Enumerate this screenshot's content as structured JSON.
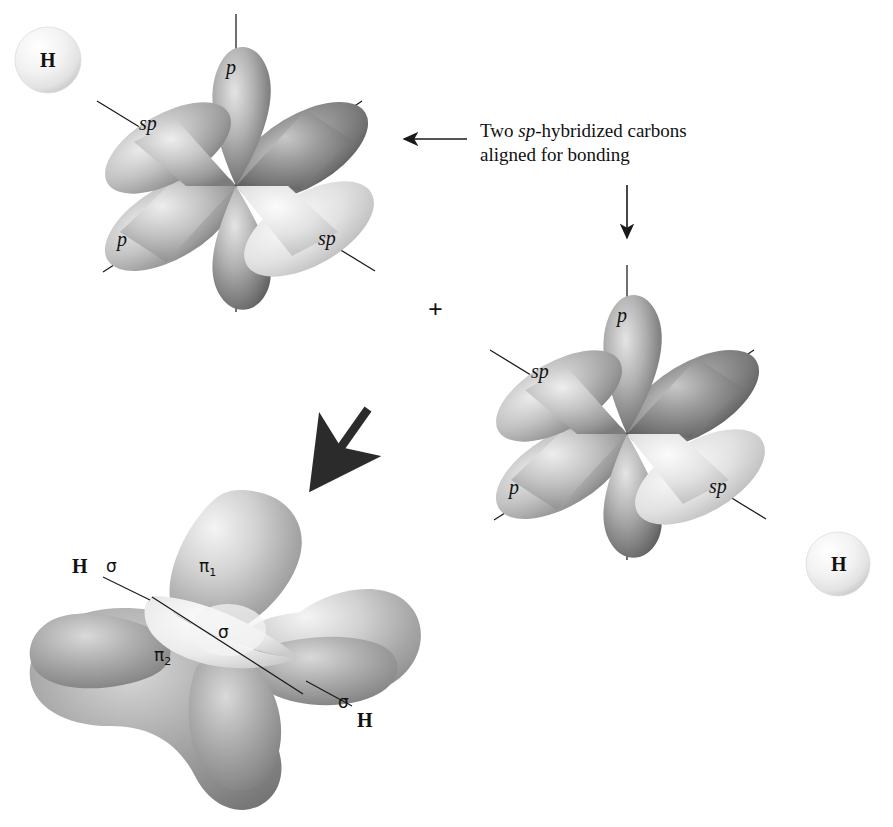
{
  "figure": {
    "plus_symbol": "+"
  },
  "annotation": {
    "line1_pre": "Two ",
    "line1_italic": "sp",
    "line1_post": "-hybridized carbons",
    "line2": "aligned for bonding"
  },
  "hydrogen_atoms": [
    {
      "label": "H",
      "position": "top-left"
    },
    {
      "label": "H",
      "position": "bottom-right"
    }
  ],
  "orbital_set_1": {
    "name": "sp-hybridized carbon (upper left)",
    "lobes": [
      {
        "label": "p",
        "direction": "up"
      },
      {
        "label": "p",
        "direction": "down"
      },
      {
        "label": "sp",
        "direction": "upper-left"
      },
      {
        "label": "sp",
        "direction": "lower-right"
      },
      {
        "label": "",
        "direction": "upper-right"
      },
      {
        "label": "",
        "direction": "lower-left"
      }
    ],
    "visible_labels": [
      "p",
      "sp",
      "p",
      "sp"
    ]
  },
  "orbital_set_2": {
    "name": "sp-hybridized carbon (lower right)",
    "lobes": [
      {
        "label": "p",
        "direction": "up"
      },
      {
        "label": "p",
        "direction": "down"
      },
      {
        "label": "sp",
        "direction": "upper-left"
      },
      {
        "label": "sp",
        "direction": "lower-right"
      },
      {
        "label": "",
        "direction": "upper-right"
      },
      {
        "label": "",
        "direction": "lower-left"
      }
    ],
    "visible_labels": [
      "p",
      "sp",
      "p",
      "sp"
    ]
  },
  "bonded_molecule": {
    "name": "acetylene molecular orbital picture",
    "pi_labels": [
      {
        "symbol": "π",
        "subscript": "1"
      },
      {
        "symbol": "π",
        "subscript": "2"
      }
    ],
    "sigma_labels": [
      {
        "symbol": "σ",
        "role": "left C-H sigma bond"
      },
      {
        "symbol": "σ",
        "role": "central C-C sigma bond"
      },
      {
        "symbol": "σ",
        "role": "right C-H sigma bond"
      }
    ],
    "hydrogen_labels": [
      "H",
      "H"
    ]
  },
  "arrows": [
    {
      "name": "annotation-pointer",
      "style": "thin",
      "direction": "left"
    },
    {
      "name": "reaction-down",
      "style": "thin",
      "direction": "down"
    },
    {
      "name": "reaction-diagonal",
      "style": "thick",
      "direction": "down-left"
    }
  ],
  "colors": {
    "background": "#ffffff",
    "lobe_dark": "#6f6f6f",
    "lobe_mid": "#9a9a9a",
    "lobe_light": "#d8d8d8",
    "lobe_highlight": "#f1f1f1",
    "line": "#1a1a1a",
    "text": "#111111",
    "sphere_fill": "#ededed"
  }
}
